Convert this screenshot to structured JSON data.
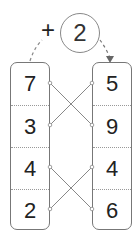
{
  "operation": {
    "operator": "+",
    "addend": "2"
  },
  "left_column": [
    "7",
    "3",
    "4",
    "2"
  ],
  "right_column": [
    "5",
    "9",
    "4",
    "6"
  ],
  "connections": [
    {
      "from_left_row": 0,
      "to_right_row": 1
    },
    {
      "from_left_row": 1,
      "to_right_row": 0
    },
    {
      "from_left_row": 2,
      "to_right_row": 3
    },
    {
      "from_left_row": 3,
      "to_right_row": 2
    }
  ],
  "colors": {
    "border": "#777777",
    "line": "#777777",
    "text": "#222222"
  }
}
